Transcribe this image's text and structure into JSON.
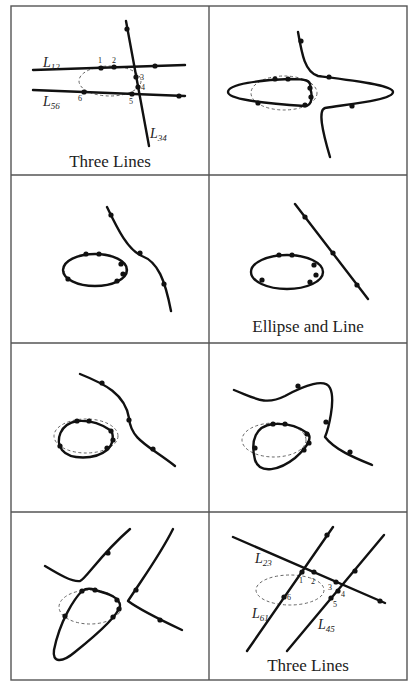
{
  "figure": {
    "layout": {
      "rows": 4,
      "cols": 2
    },
    "panels": [
      {
        "id": "p1",
        "caption": "Three Lines",
        "labels": [
          {
            "main": "L",
            "sub": "12"
          },
          {
            "main": "L",
            "sub": "56"
          },
          {
            "main": "L",
            "sub": "34"
          }
        ],
        "point_numbers": [
          "1",
          "2",
          "3",
          "4",
          "5",
          "6"
        ]
      },
      {
        "id": "p2",
        "caption": ""
      },
      {
        "id": "p3",
        "caption": ""
      },
      {
        "id": "p4",
        "caption": "Ellipse and Line"
      },
      {
        "id": "p5",
        "caption": ""
      },
      {
        "id": "p6",
        "caption": ""
      },
      {
        "id": "p7",
        "caption": ""
      },
      {
        "id": "p8",
        "caption": "Three Lines",
        "labels": [
          {
            "main": "L",
            "sub": "23"
          },
          {
            "main": "L",
            "sub": "61"
          },
          {
            "main": "L",
            "sub": "45"
          }
        ],
        "point_numbers": [
          "1",
          "2",
          "3",
          "4",
          "5",
          "6"
        ]
      }
    ]
  }
}
